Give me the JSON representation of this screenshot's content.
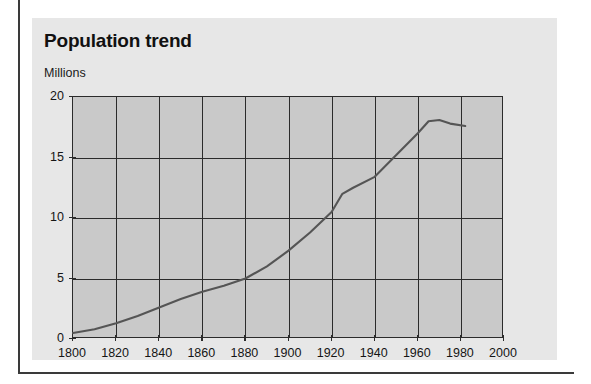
{
  "figure": {
    "title": "Population trend",
    "y_unit_label": "Millions"
  },
  "colors": {
    "page_background": "#ffffff",
    "panel_background": "#e7e7e7",
    "plot_background": "#c9c9c9",
    "axis": "#2b2b2b",
    "grid": "#2b2b2b",
    "series_line": "#555555",
    "text": "#151515",
    "page_rule": "#3a3a3a"
  },
  "chart_data": {
    "type": "line",
    "title": "Population trend",
    "subtitle": "",
    "xlabel": "",
    "ylabel": "Millions",
    "xlim": [
      1800,
      2000
    ],
    "ylim": [
      0,
      20
    ],
    "xticks": [
      1800,
      1820,
      1840,
      1860,
      1880,
      1900,
      1920,
      1940,
      1960,
      1980,
      2000
    ],
    "xtick_labels": [
      "1800",
      "1820",
      "1840",
      "1860",
      "1880",
      "1900",
      "1920",
      "1940",
      "1960",
      "1980",
      "2000"
    ],
    "yticks": [
      0,
      5,
      10,
      15,
      20
    ],
    "ytick_labels": [
      "0",
      "5",
      "10",
      "15",
      "20"
    ],
    "grid": true,
    "grid_axes": "both",
    "legend": false,
    "legend_position": "none",
    "annotations": [],
    "series": [
      {
        "name": "Population",
        "units": "millions",
        "x": [
          1800,
          1810,
          1820,
          1830,
          1840,
          1850,
          1860,
          1870,
          1880,
          1890,
          1900,
          1910,
          1920,
          1925,
          1930,
          1940,
          1950,
          1960,
          1965,
          1970,
          1975,
          1982
        ],
        "values": [
          0.5,
          0.8,
          1.3,
          1.9,
          2.6,
          3.3,
          3.9,
          4.4,
          5.0,
          6.0,
          7.3,
          8.8,
          10.5,
          12.0,
          12.5,
          13.4,
          15.2,
          17.0,
          18.0,
          18.1,
          17.8,
          17.6
        ]
      }
    ]
  }
}
